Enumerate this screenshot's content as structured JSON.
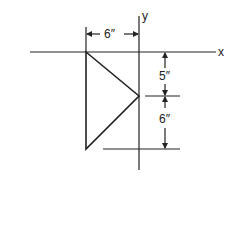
{
  "diagram": {
    "axes": {
      "x_label": "x",
      "y_label": "y"
    },
    "dimensions": {
      "horizontal": "6″",
      "upper_vertical": "5″",
      "lower_vertical": "6″"
    },
    "shape": "triangle",
    "line_color": "#222222"
  }
}
